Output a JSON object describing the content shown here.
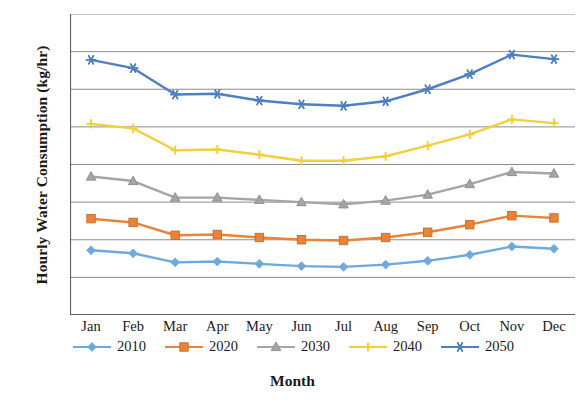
{
  "chart_data": {
    "type": "line",
    "title": "",
    "xlabel": "Month",
    "ylabel": "Hourly Water Consumption (kg/hr)",
    "ylim": [
      5,
      45
    ],
    "ytick_step": 5,
    "yticks": [
      45,
      40,
      35,
      30,
      25,
      20,
      15,
      10,
      5
    ],
    "grid": true,
    "legend_position": "bottom",
    "categories": [
      "Jan",
      "Feb",
      "Mar",
      "Apr",
      "May",
      "Jun",
      "Jul",
      "Aug",
      "Sep",
      "Oct",
      "Nov",
      "Dec"
    ],
    "series": [
      {
        "name": "2010",
        "color": "#6DA9DC",
        "marker": "diamond",
        "values": [
          13.6,
          13.2,
          12.0,
          12.1,
          11.8,
          11.5,
          11.4,
          11.7,
          12.2,
          13.0,
          14.1,
          13.8
        ]
      },
      {
        "name": "2020",
        "color": "#E8833A",
        "marker": "square",
        "values": [
          17.8,
          17.3,
          15.6,
          15.7,
          15.3,
          15.0,
          14.9,
          15.3,
          16.0,
          17.0,
          18.2,
          17.9
        ]
      },
      {
        "name": "2030",
        "color": "#A5A5A5",
        "marker": "triangle",
        "values": [
          23.4,
          22.8,
          20.6,
          20.6,
          20.3,
          20.0,
          19.7,
          20.2,
          21.0,
          22.4,
          24.0,
          23.8
        ]
      },
      {
        "name": "2040",
        "color": "#F2D03C",
        "marker": "cross",
        "values": [
          30.4,
          29.8,
          26.9,
          27.0,
          26.3,
          25.5,
          25.5,
          26.1,
          27.5,
          29.0,
          31.0,
          30.5
        ]
      },
      {
        "name": "2050",
        "color": "#4E7FC1",
        "marker": "asterisk",
        "values": [
          38.9,
          37.8,
          34.3,
          34.4,
          33.5,
          33.0,
          32.8,
          33.4,
          35.0,
          37.0,
          39.6,
          39.0
        ]
      }
    ]
  }
}
